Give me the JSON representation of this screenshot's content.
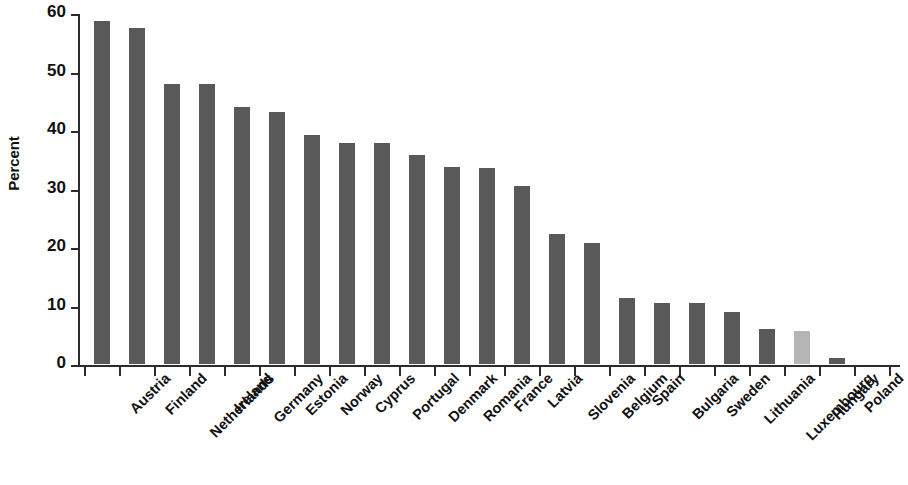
{
  "chart_data": {
    "type": "bar",
    "title": "",
    "xlabel": "",
    "ylabel": "Percent",
    "ylim": [
      0,
      60
    ],
    "yticks": [
      0,
      10,
      20,
      30,
      40,
      50,
      60
    ],
    "ytick_labels": [
      "0",
      "10",
      "20",
      "30",
      "40",
      "50",
      "60"
    ],
    "grid": false,
    "legend": null,
    "bar_color": "#595959",
    "highlight_color": "#b5b5b5",
    "highlight_category": "Hungary",
    "categories": [
      "Austria",
      "Finland",
      "Netherlands",
      "Ireland",
      "Germany",
      "Estonia",
      "Norway",
      "Cyprus",
      "Portugal",
      "Denmark",
      "Romania",
      "France",
      "Latvia",
      "Slovenia",
      "Belgium",
      "Spain",
      "Bulgaria",
      "Sweden",
      "Lithuania",
      "Luxembourg",
      "Hungary",
      "Poland",
      "Slovak Republic"
    ],
    "values": [
      58.6,
      57.5,
      47.9,
      47.8,
      44.0,
      43.0,
      39.1,
      37.8,
      37.7,
      35.8,
      33.6,
      33.5,
      30.4,
      22.2,
      20.7,
      11.3,
      10.5,
      10.5,
      8.9,
      6.0,
      5.6,
      1.0,
      0.0
    ]
  }
}
